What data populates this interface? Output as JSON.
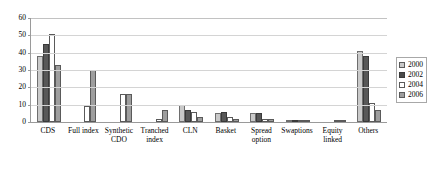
{
  "chart_data": {
    "type": "bar",
    "title": "",
    "subtitle": "",
    "xlabel": "",
    "ylabel": "",
    "ylim": [
      0,
      60
    ],
    "ytick_step": 10,
    "yticks": [
      0,
      10,
      20,
      30,
      40,
      50,
      60
    ],
    "ytick_labels": [
      "0",
      "10",
      "20",
      "30",
      "40",
      "50",
      "60"
    ],
    "grid": true,
    "grid_axis": "y",
    "legend_position": "right",
    "categories": [
      "CDS",
      "Full index",
      "Synthetic CDO",
      "Tranched index",
      "CLN",
      "Basket",
      "Spread option",
      "Swaptions",
      "Equity linked",
      "Others"
    ],
    "category_lines": [
      [
        "CDS"
      ],
      [
        "Full index"
      ],
      [
        "Synthetic",
        "CDO"
      ],
      [
        "Tranched",
        "index"
      ],
      [
        "CLN"
      ],
      [
        "Basket"
      ],
      [
        "Spread",
        "option"
      ],
      [
        "Swaptions"
      ],
      [
        "Equity",
        "linked"
      ],
      [
        "Others"
      ]
    ],
    "series": [
      {
        "name": "2000",
        "key": "s2000",
        "color": "#c9c9c9",
        "values": [
          38,
          0,
          0,
          0,
          10,
          5,
          5,
          1,
          0,
          41
        ]
      },
      {
        "name": "2002",
        "key": "s2002",
        "color": "#4a4a4a",
        "values": [
          45,
          0,
          0,
          0,
          7,
          6,
          5,
          1,
          0,
          38
        ]
      },
      {
        "name": "2004",
        "key": "s2004",
        "color": "#ffffff",
        "values": [
          51,
          9,
          16,
          2,
          6,
          3,
          2,
          1,
          1,
          11
        ]
      },
      {
        "name": "2006",
        "key": "s2006",
        "color": "#9e9e9e",
        "values": [
          33,
          30,
          16,
          7,
          3,
          2,
          2,
          1,
          1,
          7
        ]
      }
    ]
  },
  "legend": {
    "entries": [
      {
        "label": "2000",
        "key": "s2000"
      },
      {
        "label": "2002",
        "key": "s2002"
      },
      {
        "label": "2004",
        "key": "s2004"
      },
      {
        "label": "2006",
        "key": "s2006"
      }
    ]
  }
}
